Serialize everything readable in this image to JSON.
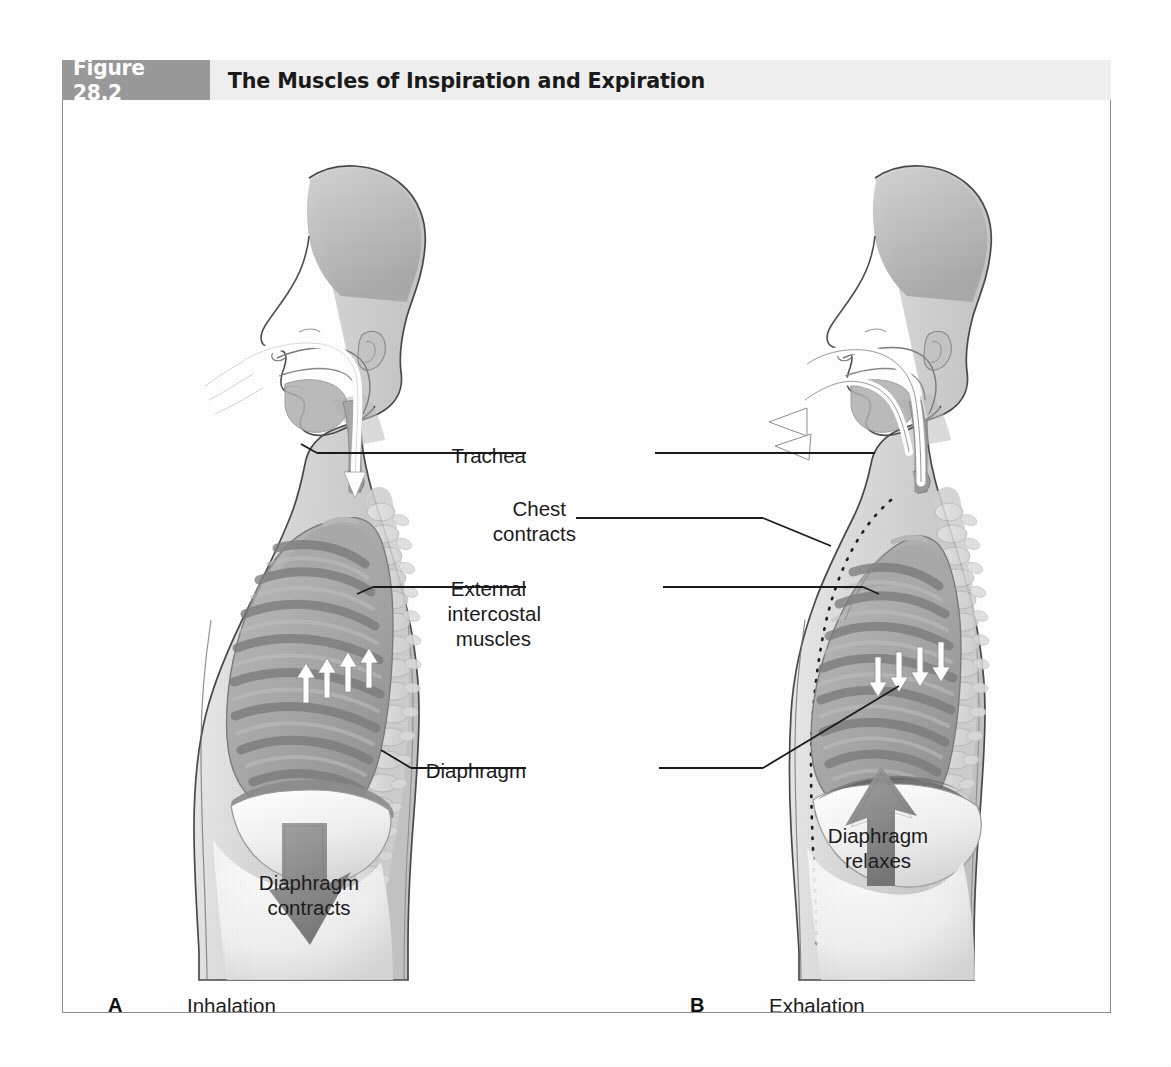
{
  "figure": {
    "number": "Figure 28.2",
    "title": "The Muscles of Inspiration and Expiration"
  },
  "labels": {
    "trachea": "Trachea",
    "chest_contracts_line1": "Chest",
    "chest_contracts_line2": "contracts",
    "external_line1": "External",
    "external_line2": "intercostal",
    "external_line3": "muscles",
    "diaphragm": "Diaphragm",
    "diaphragm_contracts_line1": "Diaphragm",
    "diaphragm_contracts_line2": "contracts",
    "diaphragm_relaxes_line1": "Diaphragm",
    "diaphragm_relaxes_line2": "relaxes"
  },
  "panels": [
    {
      "letter": "A",
      "caption": "Inhalation"
    },
    {
      "letter": "B",
      "caption": "Exhalation"
    }
  ],
  "colors": {
    "number_box": "#9a9a9a",
    "title_box": "#f0f0f0",
    "frame_border": "#8c8c8c",
    "label_text": "#1c1c1c",
    "leader_line": "#1a1a1a",
    "body_outline": "#4a4a4a",
    "ribcage_fill": "#9e9e9e",
    "rib_band": "#7e7e7e",
    "lung_fill": "#b5b5b5",
    "spine_fill": "#dcdcdc",
    "big_arrow": "#8a8a8a",
    "small_arrow": "#ffffff",
    "diaphragm_fill": "#ededed"
  },
  "icons": {
    "inhale_airflow": "airflow-in-arrow-icon",
    "exhale_airflow": "airflow-out-arrow-icon",
    "intercostal_up": "intercostal-up-arrow-icon",
    "intercostal_down": "intercostal-down-arrow-icon",
    "diaphragm_down": "diaphragm-down-arrow-icon",
    "diaphragm_up": "diaphragm-up-arrow-icon",
    "prior_chest_outline": "dotted-outline-icon"
  }
}
